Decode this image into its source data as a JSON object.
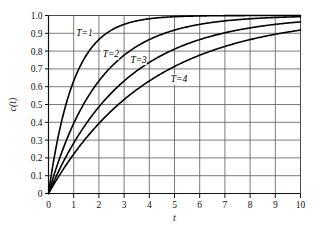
{
  "chart_data": {
    "type": "line",
    "title": "",
    "xlabel": "t",
    "ylabel": "c(t)",
    "xlim": [
      0,
      10
    ],
    "ylim": [
      0,
      1.0
    ],
    "grid": true,
    "legend_position": "inline-annotations",
    "x_ticks": [
      "0",
      "1",
      "2",
      "3",
      "4",
      "5",
      "6",
      "7",
      "8",
      "9",
      "10"
    ],
    "x_tick_values": [
      0,
      1,
      2,
      3,
      4,
      5,
      6,
      7,
      8,
      9,
      10
    ],
    "y_ticks": [
      "0",
      "0.1",
      "0.2",
      "0.3",
      "0.4",
      "0.5",
      "0.6",
      "0.7",
      "0.8",
      "0.9",
      "1.0"
    ],
    "y_tick_values": [
      0,
      0.1,
      0.2,
      0.3,
      0.4,
      0.5,
      0.6,
      0.7,
      0.8,
      0.9,
      1.0
    ],
    "formula": "c(t) = 1 - exp(-t/T)",
    "x": [
      0,
      0.25,
      0.5,
      0.75,
      1,
      1.5,
      2,
      2.5,
      3,
      3.5,
      4,
      4.5,
      5,
      5.5,
      6,
      6.5,
      7,
      7.5,
      8,
      8.5,
      9,
      9.5,
      10
    ],
    "series": [
      {
        "name": "T=1",
        "T": 1,
        "label": "T=1",
        "label_x": 1.1,
        "label_y": 0.885,
        "values": [
          0,
          0.221,
          0.393,
          0.528,
          0.632,
          0.777,
          0.865,
          0.918,
          0.95,
          0.97,
          0.982,
          0.989,
          0.993,
          0.996,
          0.998,
          0.998,
          0.999,
          0.999,
          1.0,
          1.0,
          1.0,
          1.0,
          1.0
        ]
      },
      {
        "name": "T=2",
        "T": 2,
        "label": "T=2",
        "label_x": 2.15,
        "label_y": 0.765,
        "values": [
          0,
          0.118,
          0.221,
          0.313,
          0.393,
          0.528,
          0.632,
          0.713,
          0.777,
          0.826,
          0.865,
          0.895,
          0.918,
          0.936,
          0.95,
          0.961,
          0.97,
          0.976,
          0.982,
          0.986,
          0.989,
          0.991,
          0.993
        ]
      },
      {
        "name": "T=3",
        "T": 3,
        "label": "T=3",
        "label_x": 3.25,
        "label_y": 0.735,
        "values": [
          0,
          0.08,
          0.154,
          0.221,
          0.283,
          0.393,
          0.487,
          0.565,
          0.632,
          0.688,
          0.736,
          0.777,
          0.811,
          0.84,
          0.865,
          0.886,
          0.903,
          0.918,
          0.931,
          0.941,
          0.95,
          0.958,
          0.964
        ]
      },
      {
        "name": "T=4",
        "T": 4,
        "label": "T=4",
        "label_x": 4.85,
        "label_y": 0.625,
        "values": [
          0,
          0.061,
          0.118,
          0.171,
          0.221,
          0.313,
          0.393,
          0.465,
          0.528,
          0.583,
          0.632,
          0.675,
          0.713,
          0.747,
          0.777,
          0.803,
          0.826,
          0.847,
          0.865,
          0.881,
          0.895,
          0.907,
          0.918
        ]
      }
    ],
    "colors": {
      "curve": "#000000",
      "grid": "#5a5a5a",
      "axis": "#111111",
      "background": "#ffffff"
    }
  }
}
